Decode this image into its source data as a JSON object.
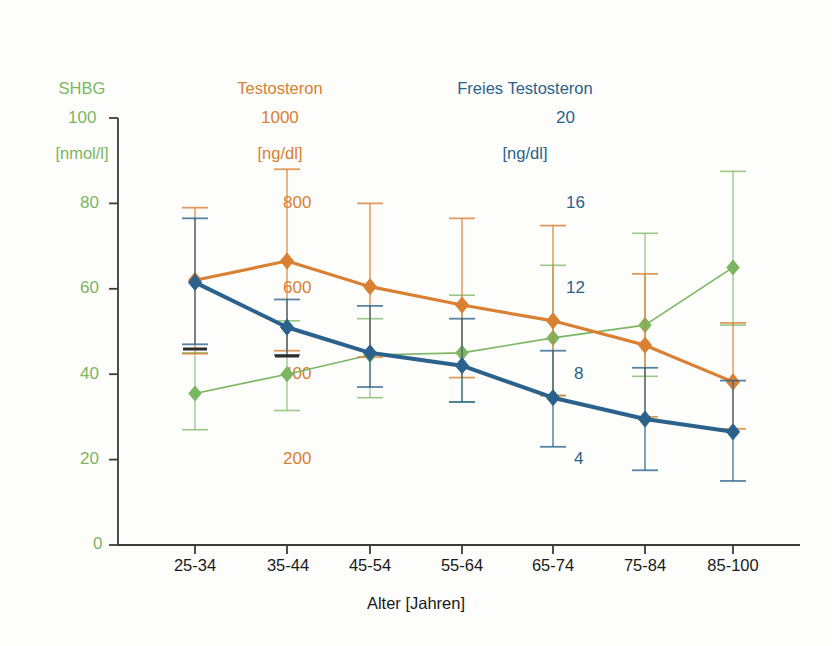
{
  "figure": {
    "background": "#fdfdfc",
    "axis_color": "#3b3b3b",
    "x_title": "Alter [Jahren]"
  },
  "legend_headers": [
    {
      "name": "shbg",
      "line1": "SHBG",
      "line2": "[nmol/l]",
      "top_value": "100",
      "color": "#7bb661"
    },
    {
      "name": "testo",
      "line1": "Testosteron",
      "line2": "[ng/dl]",
      "top_value": "1000",
      "color": "#d98032"
    },
    {
      "name": "free",
      "line1": "Freies Testosteron",
      "line2": "[ng/dl]",
      "top_value": "20",
      "color": "#2b628b"
    }
  ],
  "axes": {
    "left": {
      "name": "shbg-axis",
      "color": "#7bb661",
      "labels": [
        "100",
        "80",
        "60",
        "40",
        "20",
        "0"
      ],
      "min": 0,
      "max": 100
    },
    "middle": {
      "name": "testo-axis",
      "color": "#d98032",
      "labels": [
        "1000",
        "800",
        "600",
        "400",
        "200"
      ],
      "min": 0,
      "max": 1000
    },
    "right": {
      "name": "free-axis",
      "color": "#2b628b",
      "labels": [
        "20",
        "16",
        "12",
        "8",
        "4"
      ],
      "min": 0,
      "max": 20
    }
  },
  "chart_data": {
    "type": "line",
    "title": "",
    "xlabel": "Alter [Jahren]",
    "ylabel": "",
    "grid": false,
    "legend_position": "top",
    "categories": [
      "25-34",
      "35-44",
      "45-54",
      "55-64",
      "65-74",
      "75-84",
      "85-100"
    ],
    "axis_ranges": {
      "shbg_nmol_l": [
        0,
        100
      ],
      "testosteron_ng_dl": [
        0,
        1000
      ],
      "freies_testosteron_ng_dl": [
        0,
        20
      ]
    },
    "series": [
      {
        "name": "SHBG [nmol/l]",
        "key": "shbg",
        "color": "#7bb661",
        "axis": "left",
        "values": [
          35.5,
          40.0,
          44.5,
          45.0,
          48.5,
          51.5,
          65.0
        ],
        "err_upper": [
          45.0,
          52.5,
          53.0,
          58.5,
          65.5,
          73.0,
          87.5
        ],
        "err_lower": [
          27.0,
          31.5,
          34.5,
          33.5,
          35.0,
          39.5,
          51.5
        ]
      },
      {
        "name": "Testosteron [ng/dl]",
        "key": "testosteron",
        "color": "#d98032",
        "axis": "middle",
        "values": [
          620,
          665,
          605,
          562,
          525,
          468,
          382
        ],
        "err_upper": [
          790,
          880,
          800,
          765,
          748,
          635,
          520
        ],
        "err_lower": [
          448,
          455,
          440,
          392,
          350,
          300,
          272
        ]
      },
      {
        "name": "Freies Testosteron [ng/dl]",
        "key": "freies_testosteron",
        "color": "#2b628b",
        "axis": "right",
        "values": [
          12.3,
          10.2,
          9.0,
          8.4,
          6.9,
          5.9,
          5.3
        ],
        "err_upper": [
          15.3,
          11.5,
          11.2,
          10.6,
          9.1,
          8.3,
          7.7
        ],
        "err_lower": [
          9.4,
          8.9,
          7.4,
          6.7,
          4.6,
          3.5,
          3.0
        ]
      }
    ]
  }
}
